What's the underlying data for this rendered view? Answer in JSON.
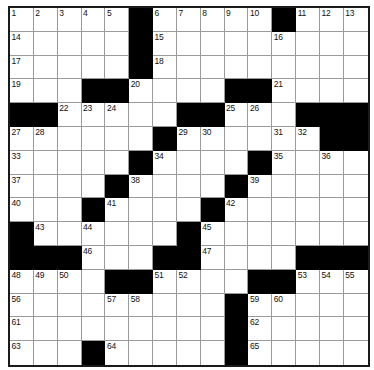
{
  "puzzle": {
    "title": "Crossword Grid",
    "size_label": "15 x 15",
    "rows": 15,
    "cols": 15,
    "colors": {
      "block": "#000000",
      "cell": "#ffffff",
      "cell_border": "#9a9a9a",
      "grid_border": "#1a1a1a",
      "number_text": "#111111"
    },
    "layout": [
      ".....#.....#...",
      ".....#.........",
      ".....#.........",
      "...##....##....",
      "##.....##...###",
      "......#.....##.",
      ".....#....#....",
      "....#....#.....",
      "...#....#......",
      "#..........####",
      "###...##...####",
      "....##....##...",
      "....................",
      "",
      ""
    ],
    "grid": [
      [
        "w",
        "w",
        "w",
        "w",
        "w",
        "b",
        "w",
        "w",
        "w",
        "w",
        "w",
        "b",
        "w",
        "w",
        "w"
      ],
      [
        "w",
        "w",
        "w",
        "w",
        "w",
        "b",
        "w",
        "w",
        "w",
        "w",
        "w",
        "w",
        "w",
        "w",
        "w"
      ],
      [
        "w",
        "w",
        "w",
        "w",
        "w",
        "b",
        "w",
        "w",
        "w",
        "w",
        "w",
        "w",
        "w",
        "w",
        "w"
      ],
      [
        "w",
        "w",
        "w",
        "b",
        "b",
        "w",
        "w",
        "w",
        "w",
        "b",
        "b",
        "w",
        "w",
        "w",
        "w"
      ],
      [
        "b",
        "b",
        "w",
        "w",
        "w",
        "w",
        "w",
        "b",
        "b",
        "w",
        "w",
        "w",
        "b",
        "b",
        "b"
      ],
      [
        "w",
        "w",
        "w",
        "w",
        "w",
        "w",
        "b",
        "w",
        "w",
        "w",
        "w",
        "w",
        "w",
        "b",
        "b"
      ],
      [
        "w",
        "w",
        "w",
        "w",
        "w",
        "b",
        "w",
        "w",
        "w",
        "w",
        "b",
        "w",
        "w",
        "w",
        "w"
      ],
      [
        "w",
        "w",
        "w",
        "w",
        "b",
        "w",
        "w",
        "w",
        "w",
        "b",
        "w",
        "w",
        "w",
        "w",
        "w"
      ],
      [
        "w",
        "w",
        "w",
        "b",
        "w",
        "w",
        "w",
        "w",
        "b",
        "w",
        "w",
        "w",
        "w",
        "w",
        "w"
      ],
      [
        "b",
        "w",
        "w",
        "w",
        "w",
        "w",
        "w",
        "b",
        "w",
        "w",
        "w",
        "w",
        "w",
        "w",
        "w"
      ],
      [
        "b",
        "b",
        "b",
        "w",
        "w",
        "w",
        "b",
        "b",
        "w",
        "w",
        "w",
        "w",
        "b",
        "b",
        "b"
      ],
      [
        "w",
        "w",
        "w",
        "w",
        "b",
        "b",
        "w",
        "w",
        "w",
        "w",
        "b",
        "b",
        "w",
        "w",
        "w"
      ],
      [
        "w",
        "w",
        "w",
        "w",
        "w",
        "w",
        "w",
        "w",
        "w",
        "b",
        "w",
        "w",
        "w",
        "w",
        "w"
      ],
      [
        "w",
        "w",
        "w",
        "w",
        "w",
        "w",
        "w",
        "w",
        "w",
        "b",
        "w",
        "w",
        "w",
        "w",
        "w"
      ],
      [
        "w",
        "w",
        "w",
        "b",
        "w",
        "w",
        "w",
        "w",
        "w",
        "b",
        "w",
        "w",
        "w",
        "w",
        "w"
      ]
    ],
    "numbers": [
      [
        1,
        2,
        3,
        4,
        5,
        0,
        6,
        7,
        8,
        9,
        10,
        0,
        11,
        12,
        13
      ],
      [
        14,
        0,
        0,
        0,
        0,
        0,
        15,
        0,
        0,
        0,
        0,
        16,
        0,
        0,
        0
      ],
      [
        17,
        0,
        0,
        0,
        0,
        0,
        18,
        0,
        0,
        0,
        0,
        0,
        0,
        0,
        0
      ],
      [
        19,
        0,
        0,
        0,
        0,
        20,
        0,
        0,
        0,
        0,
        0,
        21,
        0,
        0,
        0
      ],
      [
        0,
        0,
        22,
        23,
        24,
        0,
        0,
        0,
        0,
        25,
        26,
        0,
        0,
        0,
        0
      ],
      [
        27,
        28,
        0,
        0,
        0,
        0,
        0,
        29,
        30,
        0,
        0,
        31,
        32,
        0,
        0
      ],
      [
        33,
        0,
        0,
        0,
        0,
        0,
        34,
        0,
        0,
        0,
        0,
        35,
        0,
        36,
        0
      ],
      [
        37,
        0,
        0,
        0,
        0,
        38,
        0,
        0,
        0,
        0,
        39,
        0,
        0,
        0,
        0
      ],
      [
        40,
        0,
        0,
        0,
        41,
        0,
        0,
        0,
        0,
        42,
        0,
        0,
        0,
        0,
        0
      ],
      [
        0,
        43,
        0,
        44,
        0,
        0,
        0,
        0,
        45,
        0,
        0,
        0,
        0,
        0,
        0
      ],
      [
        0,
        0,
        0,
        46,
        0,
        0,
        0,
        0,
        47,
        0,
        0,
        0,
        0,
        0,
        0
      ],
      [
        48,
        49,
        50,
        0,
        0,
        0,
        51,
        52,
        0,
        0,
        0,
        0,
        53,
        54,
        55
      ],
      [
        56,
        0,
        0,
        0,
        57,
        58,
        0,
        0,
        0,
        0,
        59,
        60,
        0,
        0,
        0
      ],
      [
        61,
        0,
        0,
        0,
        0,
        0,
        0,
        0,
        0,
        0,
        62,
        0,
        0,
        0,
        0
      ],
      [
        63,
        0,
        0,
        0,
        64,
        0,
        0,
        0,
        0,
        0,
        65,
        0,
        0,
        0,
        0
      ]
    ],
    "letters": [
      [
        "",
        "",
        "",
        "",
        "",
        "",
        "",
        "",
        "",
        "",
        "",
        "",
        "",
        "",
        ""
      ],
      [
        "",
        "",
        "",
        "",
        "",
        "",
        "",
        "",
        "",
        "",
        "",
        "",
        "",
        "",
        ""
      ],
      [
        "",
        "",
        "",
        "",
        "",
        "",
        "",
        "",
        "",
        "",
        "",
        "",
        "",
        "",
        ""
      ],
      [
        "",
        "",
        "",
        "",
        "",
        "",
        "",
        "",
        "",
        "",
        "",
        "",
        "",
        "",
        ""
      ],
      [
        "",
        "",
        "",
        "",
        "",
        "",
        "",
        "",
        "",
        "",
        "",
        "",
        "",
        "",
        ""
      ],
      [
        "",
        "",
        "",
        "",
        "",
        "",
        "",
        "",
        "",
        "",
        "",
        "",
        "",
        "",
        ""
      ],
      [
        "",
        "",
        "",
        "",
        "",
        "",
        "",
        "",
        "",
        "",
        "",
        "",
        "",
        "",
        ""
      ],
      [
        "",
        "",
        "",
        "",
        "",
        "",
        "",
        "",
        "",
        "",
        "",
        "",
        "",
        "",
        ""
      ],
      [
        "",
        "",
        "",
        "",
        "",
        "",
        "",
        "",
        "",
        "",
        "",
        "",
        "",
        "",
        ""
      ],
      [
        "",
        "",
        "",
        "",
        "",
        "",
        "",
        "",
        "",
        "",
        "",
        "",
        "",
        "",
        ""
      ],
      [
        "",
        "",
        "",
        "",
        "",
        "",
        "",
        "",
        "",
        "",
        "",
        "",
        "",
        "",
        ""
      ],
      [
        "",
        "",
        "",
        "",
        "",
        "",
        "",
        "",
        "",
        "",
        "",
        "",
        "",
        "",
        ""
      ],
      [
        "",
        "",
        "",
        "",
        "",
        "",
        "",
        "",
        "",
        "",
        "",
        "",
        "",
        "",
        ""
      ],
      [
        "",
        "",
        "",
        "",
        "",
        "",
        "",
        "",
        "",
        "",
        "",
        "",
        "",
        "",
        ""
      ],
      [
        "",
        "",
        "",
        "",
        "",
        "",
        "",
        "",
        "",
        "",
        "",
        "",
        "",
        "",
        ""
      ]
    ],
    "max_number": 65
  }
}
